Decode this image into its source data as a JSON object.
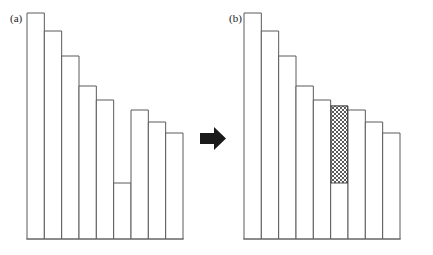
{
  "figure": {
    "caption_a": "(a)",
    "caption_b": "(b)",
    "arrow_glyph": "right-arrow",
    "bar_fill_color": "#ffffff",
    "bar_stroke_color": "#5a5a5a",
    "hatch_color": "#4a4a4a",
    "arrow_color": "#1a1a1a",
    "background_color": "#ffffff"
  },
  "chart_data": {
    "type": "bar",
    "title": "",
    "subtitle": "",
    "xlabel": "",
    "ylabel": "",
    "grid": false,
    "legend": null,
    "axis": {
      "x_axis_visible": true,
      "y_axis_visible": false,
      "x_tick_labels": [],
      "y_tick_labels": [],
      "ylim": [
        0,
        240
      ]
    },
    "panels": [
      {
        "label": "(a)",
        "description": "Descending bar sequence with a deep notch at the sixth bar",
        "categories": [
          "1",
          "2",
          "3",
          "4",
          "5",
          "6",
          "7",
          "8",
          "9"
        ],
        "values": [
          226,
          208,
          183,
          153,
          139,
          56,
          129,
          117,
          106
        ],
        "hatched_indices": [],
        "notch_index": 5
      },
      {
        "label": "(b)",
        "description": "Same sequence with the notch filled by a hatched block restoring monotonic decrease",
        "categories": [
          "1",
          "2",
          "3",
          "4",
          "5",
          "6",
          "7",
          "8",
          "9"
        ],
        "values": [
          226,
          208,
          183,
          153,
          139,
          133,
          129,
          117,
          106
        ],
        "hatched_indices": [
          5
        ],
        "hatched_fill_from": 56,
        "hatched_fill_to": 133,
        "notch_index": null
      }
    ],
    "annotations": [
      {
        "type": "arrow",
        "direction": "right",
        "from_panel": "(a)",
        "to_panel": "(b)"
      }
    ]
  }
}
